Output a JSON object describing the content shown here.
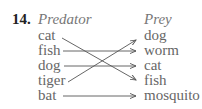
{
  "problem_number": "14.",
  "headers": {
    "left": "Predator",
    "right": "Prey"
  },
  "predators": [
    "cat",
    "fish",
    "dog",
    "tiger",
    "bat"
  ],
  "prey": [
    "dog",
    "worm",
    "cat",
    "fish",
    "mosquito"
  ],
  "mappings": [
    {
      "from": "cat",
      "to": "fish"
    },
    {
      "from": "fish",
      "to": "worm"
    },
    {
      "from": "dog",
      "to": "cat"
    },
    {
      "from": "tiger",
      "to": "dog"
    },
    {
      "from": "bat",
      "to": "mosquito"
    }
  ]
}
